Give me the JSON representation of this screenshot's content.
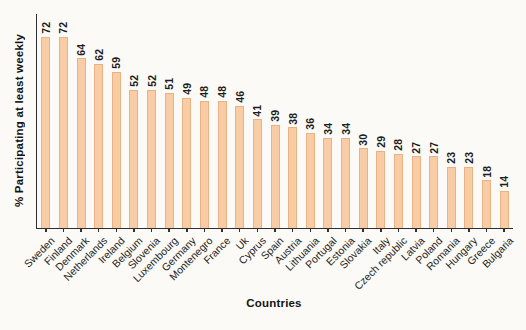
{
  "chart_data": {
    "type": "bar",
    "title": "",
    "xlabel": "Countries",
    "ylabel": "% Participating at least weekly",
    "categories": [
      "Sweden",
      "Finland",
      "Denmark",
      "Netherlands",
      "Ireland",
      "Belgium",
      "Slovenia",
      "Luxembourg",
      "Germany",
      "Montenegro",
      "France",
      "Uk",
      "Cyprus",
      "Spain",
      "Austria",
      "Lithuania",
      "Portugal",
      "Estonia",
      "Slovakia",
      "Italy",
      "Czech republic",
      "Latvia",
      "Poland",
      "Romania",
      "Hungary",
      "Greece",
      "Bulgaria"
    ],
    "values": [
      72,
      72,
      64,
      62,
      59,
      52,
      52,
      51,
      49,
      48,
      48,
      46,
      41,
      39,
      38,
      36,
      34,
      34,
      30,
      29,
      28,
      27,
      27,
      23,
      23,
      18,
      14
    ],
    "value_labels_shown": true,
    "value_label_rotation_deg": -90,
    "category_label_rotation_deg": -45,
    "ylim": [
      0,
      76
    ],
    "grid": false,
    "legend": null,
    "bar_color": "#f8cda6",
    "bar_border_color": "#eab183",
    "axis_color": "#2f2f2f",
    "background_color": "#fbfaf6"
  }
}
